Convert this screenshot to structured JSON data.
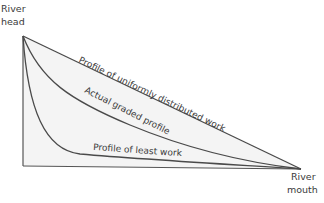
{
  "diagram": {
    "type": "river-long-profile",
    "labels": {
      "head_line1": "River",
      "head_line2": "head",
      "mouth_line1": "River",
      "mouth_line2": "mouth",
      "uniform_profile": "Profile of uniformly distributed work",
      "graded_profile": "Actual graded profile",
      "least_work_profile": "Profile of least work"
    },
    "colors": {
      "line": "#4a4a4a",
      "fill": "#f4f4f4",
      "text": "#3a3a3a",
      "background": "#ffffff"
    },
    "points": {
      "river_head": [
        23,
        36
      ],
      "river_mouth": [
        301,
        169
      ],
      "base_left": [
        23,
        166
      ]
    }
  }
}
